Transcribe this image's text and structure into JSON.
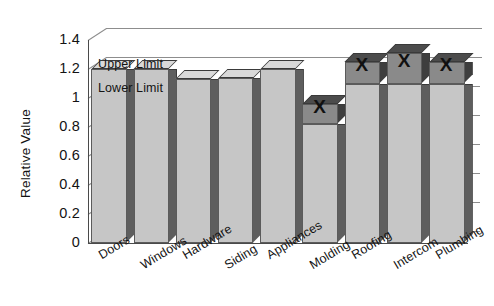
{
  "chart_data": {
    "type": "bar",
    "title": "",
    "xlabel": "",
    "ylabel": "Relative Value",
    "ylim": [
      0,
      1.4
    ],
    "ytick_labels": [
      "1.4",
      "1.2",
      "1",
      "0.8",
      "0.6",
      "0.4",
      "0.2",
      "0"
    ],
    "ytick_values": [
      1.4,
      1.2,
      1.0,
      0.8,
      0.6,
      0.4,
      0.2,
      0
    ],
    "grid": true,
    "legend": "none",
    "style": "3d-bar",
    "categories": [
      "Doors",
      "Windows",
      "Hardware",
      "Siding",
      "Appliances",
      "Molding",
      "Roofing",
      "Intercom",
      "Plumbing"
    ],
    "values": [
      1.2,
      1.2,
      1.13,
      1.14,
      1.2,
      0.96,
      1.25,
      1.31,
      1.25
    ],
    "series": [
      {
        "name": "Relative Value",
        "values": [
          1.2,
          1.2,
          1.13,
          1.14,
          1.2,
          0.96,
          1.25,
          1.31,
          1.25
        ]
      }
    ],
    "reference_lines": [
      {
        "name": "Upper Limit",
        "label": "Upper Limit",
        "value": 1.2
      },
      {
        "name": "Lower Limit",
        "label": "Lower Limit",
        "value": 1.1
      }
    ],
    "annotations": [
      {
        "name": "out-of-limit-marker",
        "category": "Molding",
        "symbol": "X"
      },
      {
        "name": "out-of-limit-marker",
        "category": "Roofing",
        "symbol": "X"
      },
      {
        "name": "out-of-limit-marker",
        "category": "Intercom",
        "symbol": "X"
      },
      {
        "name": "out-of-limit-marker",
        "category": "Plumbing",
        "symbol": "X"
      }
    ],
    "colors": {
      "bar_face": "#c6c6c6",
      "bar_side": "#5e5e5e",
      "bar_top": "#d9d9d9",
      "bar_exceed_face": "#8a8a8a",
      "bar_exceed_side": "#3e3e3e",
      "bar_exceed_top": "#4c4c4c",
      "gridline": "#8d8d8d",
      "axis": "#4a4a4a",
      "text": "#131313",
      "background": "#ffffff"
    }
  }
}
